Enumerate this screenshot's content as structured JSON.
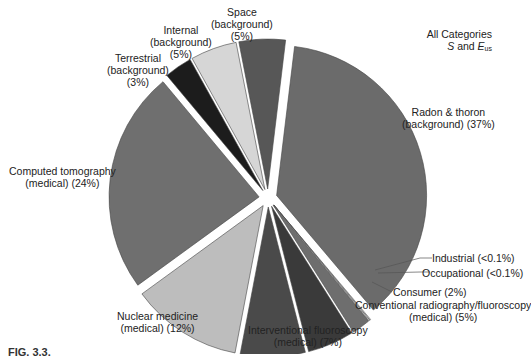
{
  "chart_data": {
    "type": "pie",
    "title": "All Categories",
    "subtitle": "S and E_us",
    "exploded": true,
    "slices": [
      {
        "label": "Radon & thoron (background)",
        "value": 37,
        "display": "37%",
        "color": "#6b6b6b"
      },
      {
        "label": "Industrial",
        "value": 0.1,
        "display": "<0.1%",
        "color": "#ffffff"
      },
      {
        "label": "Occupational",
        "value": 0.1,
        "display": "<0.1%",
        "color": "#ffffff"
      },
      {
        "label": "Consumer",
        "value": 2,
        "display": "2%",
        "color": "#6e6e6e"
      },
      {
        "label": "Conventional radiography/fluoroscopy (medical)",
        "value": 5,
        "display": "5%",
        "color": "#3a3a3a"
      },
      {
        "label": "Interventional fluoroscopy (medical)",
        "value": 7,
        "display": "7%",
        "color": "#4a4a4a"
      },
      {
        "label": "Nuclear medicine (medical)",
        "value": 12,
        "display": "12%",
        "color": "#bdbdbd"
      },
      {
        "label": "Computed tomography (medical)",
        "value": 24,
        "display": "24%",
        "color": "#6f6f6f"
      },
      {
        "label": "Terrestrial (background)",
        "value": 3,
        "display": "3%",
        "color": "#1c1c1c"
      },
      {
        "label": "Internal (background)",
        "value": 5,
        "display": "5%",
        "color": "#d6d6d6"
      },
      {
        "label": "Space (background)",
        "value": 5,
        "display": "5%",
        "color": "#575757"
      }
    ]
  },
  "labels": {
    "title_line1": "All Categories",
    "title_S": "S",
    "title_and": " and ",
    "title_E": "E",
    "title_sub": "us",
    "radon_1": "Radon & thoron",
    "radon_2": "(background) (37%)",
    "industrial": "Industrial (<0.1%)",
    "occupational": "Occupational (<0.1%)",
    "consumer": "Consumer (2%)",
    "conventional_1": "Conventional radiography/fluoroscopy",
    "conventional_2": "(medical) (5%)",
    "interventional_1": "Interventional fluoroscopy",
    "interventional_2": "(medical) (7%)",
    "nuclear_1": "Nuclear medicine",
    "nuclear_2": "(medical) (12%)",
    "ct_1": "Computed tomography",
    "ct_2": "(medical) (24%)",
    "terrestrial_1": "Terrestrial",
    "terrestrial_2": "(background)",
    "terrestrial_3": "(3%)",
    "internal_1": "Internal",
    "internal_2": "(background)",
    "internal_3": "(5%)",
    "space_1": "Space",
    "space_2": "(background)",
    "space_3": "(5%)"
  },
  "caption": "FIG. 3.3."
}
